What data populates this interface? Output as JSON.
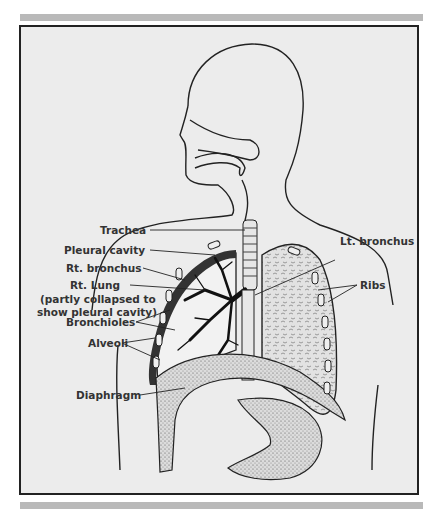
{
  "figure": {
    "labels": {
      "trachea": "Trachea",
      "pleural_cavity": "Pleural cavity",
      "rt_bronchus": "Rt. bronchus",
      "rt_lung": "Rt. Lung",
      "rt_lung_note_1": "(partly collapsed to",
      "rt_lung_note_2": "show pleural cavity)",
      "bronchioles": "Bronchioles",
      "alveoli": "Alveoli",
      "diaphragm": "Diaphragm",
      "lt_bronchus": "Lt. bronchus",
      "ribs": "Ribs"
    }
  }
}
